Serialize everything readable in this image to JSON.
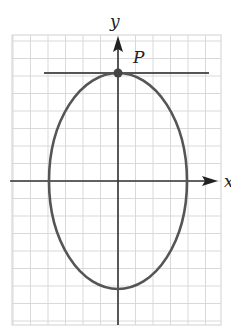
{
  "diagram": {
    "type": "ellipse-with-tangent",
    "axes": {
      "x_label": "x",
      "y_label": "y"
    },
    "point_label": "P",
    "grid": {
      "x0": 12,
      "y0": 35,
      "x1": 221,
      "y1": 325,
      "spacing": 17.5
    },
    "origin": {
      "x": 118,
      "y": 181
    },
    "ellipse": {
      "rx": 69,
      "ry": 108
    },
    "tangent_y": 73,
    "tangent_x": [
      44,
      209
    ],
    "colors": {
      "grid": "#d9d9d9",
      "axis": "#333333",
      "curve": "#555555",
      "point": "#444444"
    }
  }
}
